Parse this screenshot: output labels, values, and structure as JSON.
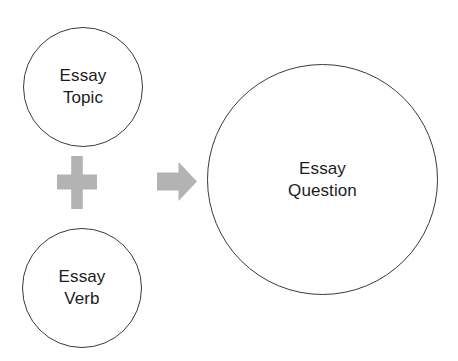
{
  "diagram": {
    "background_color": "#ffffff",
    "outline_color": "#3a3a3a",
    "operator_color": "#b3b3b3",
    "text_color": "#1c1c1c",
    "nodes": [
      {
        "id": "essay-topic",
        "label": "Essay\nTopic",
        "shape": "circle",
        "role": "input"
      },
      {
        "id": "essay-verb",
        "label": "Essay\nVerb",
        "shape": "circle",
        "role": "input"
      },
      {
        "id": "essay-question",
        "label": "Essay\nQuestion",
        "shape": "circle",
        "role": "result"
      }
    ],
    "operators": [
      {
        "id": "plus",
        "icon": "plus-icon",
        "meaning": "combine"
      },
      {
        "id": "arrow",
        "icon": "arrow-right-icon",
        "meaning": "produces"
      }
    ]
  }
}
